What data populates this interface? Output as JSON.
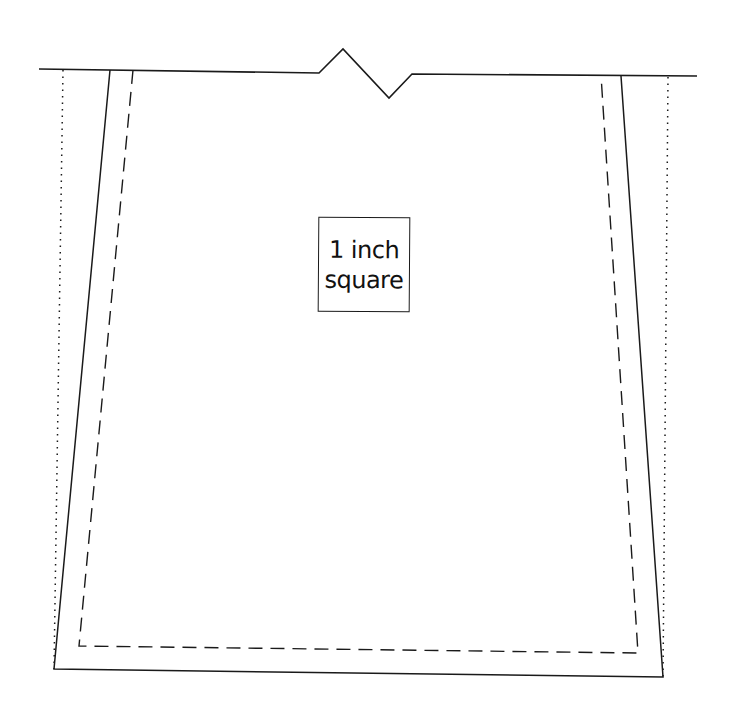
{
  "diagram": {
    "type": "sewing-pattern-piece",
    "label": {
      "line1": "1 inch",
      "line2": "square"
    },
    "colors": {
      "line": "#1a1a1a",
      "background": "#ffffff"
    },
    "elements": {
      "top_edge": "cut line with notch",
      "outer_outline": "solid cutting line",
      "inner_outline": "dashed stitching line",
      "side_guides": "dotted fold/guide lines"
    }
  }
}
